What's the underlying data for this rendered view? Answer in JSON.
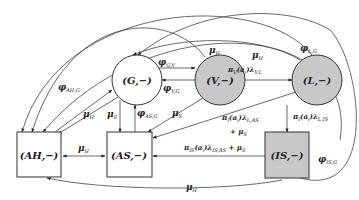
{
  "diagram": {
    "type": "state-transition",
    "nodes": [
      {
        "id": "G",
        "label": "(G,−)",
        "shape": "circle",
        "fill": "#ffffff"
      },
      {
        "id": "V",
        "label": "(V,−)",
        "shape": "circle",
        "fill": "#c8c8c8"
      },
      {
        "id": "L",
        "label": "(L,−)",
        "shape": "circle",
        "fill": "#c8c8c8"
      },
      {
        "id": "AH",
        "label": "(AH,−)",
        "shape": "box",
        "fill": "#ffffff"
      },
      {
        "id": "AS",
        "label": "(AS,−)",
        "shape": "box",
        "fill": "#ffffff"
      },
      {
        "id": "IS",
        "label": "(IS,−)",
        "shape": "box",
        "fill": "#c8c8c8"
      }
    ],
    "edge_labels": {
      "phi_GV": {
        "main": "φ",
        "sub": "G,V"
      },
      "phi_VG": {
        "main": "φ",
        "sub": "V,G"
      },
      "phi_AHG": {
        "main": "φ",
        "sub": "AH,G"
      },
      "phi_ASG": {
        "main": "φ",
        "sub": "AS,G"
      },
      "phi_LG": {
        "main": "φ",
        "sub": "L,G"
      },
      "phi_ISG": {
        "main": "φ",
        "sub": "IS,G"
      },
      "mu_H_V": {
        "main": "μ",
        "sub": "H"
      },
      "mu_H_L": {
        "main": "μ",
        "sub": "H"
      },
      "mu_H_G": {
        "main": "μ",
        "sub": "H"
      },
      "mu_S_G": {
        "main": "μ",
        "sub": "S"
      },
      "mu_S_V": {
        "main": "μ",
        "sub": "S"
      },
      "mu_H_AHAS": {
        "main": "μ",
        "sub": "H"
      },
      "mu_H_IS": {
        "main": "μ",
        "sub": "H"
      },
      "pi_VL": {
        "main": "π",
        "sub": "V",
        "rest": "(a",
        "sub2": "i",
        "rest2": ")λ",
        "sub3": "V,L"
      },
      "pi_LAS": {
        "main": "π",
        "sub": "I",
        "rest": "(a",
        "sub2": "i",
        "rest2": ")λ",
        "sub3": "L,AS"
      },
      "pi_LAS_plus": {
        "text": "+ μ",
        "sub": "S"
      },
      "pi_LIS": {
        "main": "π",
        "sub": "I",
        "rest": "(a",
        "sub2": "i",
        "rest2": ")λ",
        "sub3": "L,IS"
      },
      "pi_ISAS": {
        "main": "π",
        "sub": "IS",
        "rest": "(a",
        "sub2": "i",
        "rest2": ")λ",
        "sub3": "IS,AS",
        "plus": " + μ",
        "sub4": "S"
      }
    }
  }
}
